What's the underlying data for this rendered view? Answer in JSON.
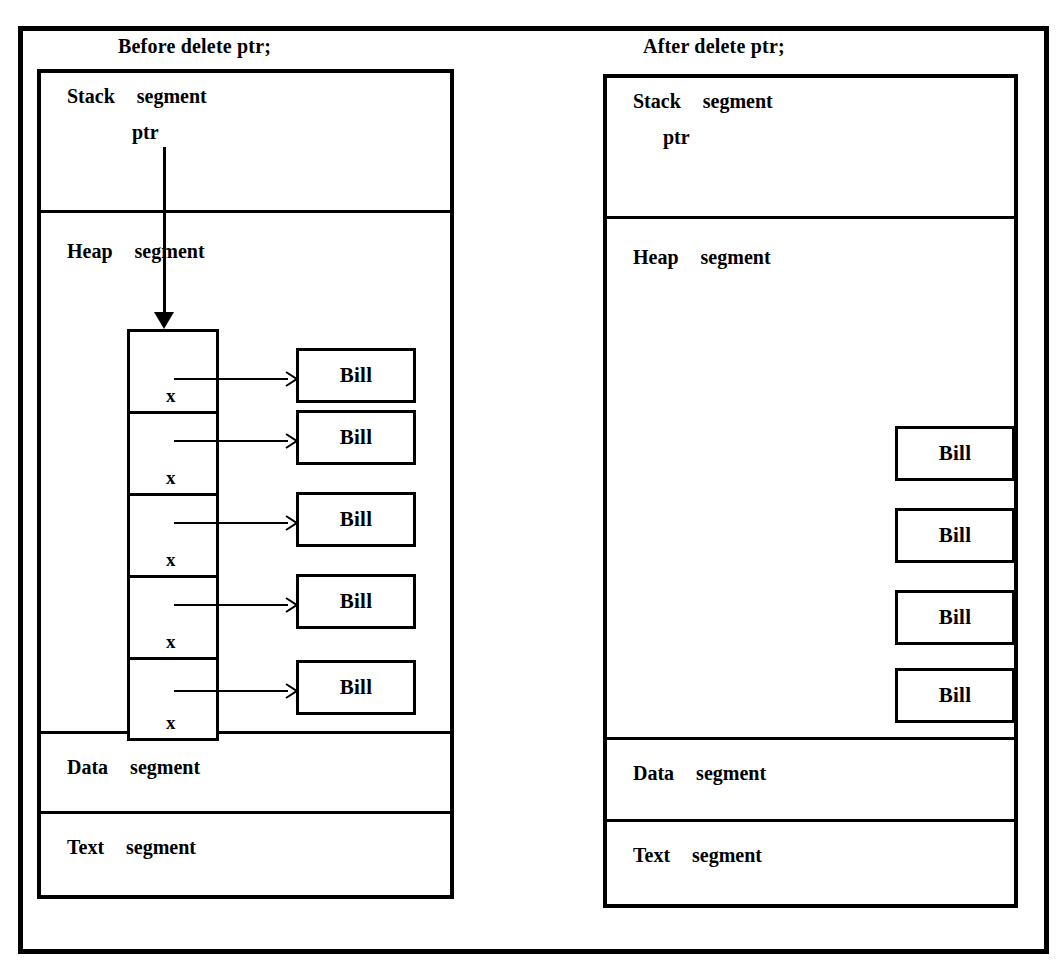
{
  "figure": {
    "ink_color": "#000000",
    "paper_color": "#ffffff"
  },
  "panels": [
    {
      "id": "before",
      "caption": "Before delete ptr;",
      "stack": {
        "segment_name": "Stack",
        "segment_word": "segment",
        "variable": "ptr",
        "pointer_is_dangling": false
      },
      "heap": {
        "segment_name": "Heap",
        "segment_word": "segment",
        "array": {
          "slot_count": 5,
          "slots": [
            {
              "value": "x",
              "points_to": "Bill"
            },
            {
              "value": "x",
              "points_to": "Bill"
            },
            {
              "value": "x",
              "points_to": "Bill"
            },
            {
              "value": "x",
              "points_to": "Bill"
            },
            {
              "value": "x",
              "points_to": "Bill"
            }
          ]
        },
        "objects": [
          {
            "label": "Bill"
          },
          {
            "label": "Bill"
          },
          {
            "label": "Bill"
          },
          {
            "label": "Bill"
          },
          {
            "label": "Bill"
          }
        ]
      },
      "data": {
        "segment_name": "Data",
        "segment_word": "segment"
      },
      "text": {
        "segment_name": "Text",
        "segment_word": "segment"
      }
    },
    {
      "id": "after",
      "caption": "After delete ptr;",
      "stack": {
        "segment_name": "Stack",
        "segment_word": "segment",
        "variable": "ptr",
        "pointer_is_dangling": true
      },
      "heap": {
        "segment_name": "Heap",
        "segment_word": "segment",
        "array": {
          "slot_count": 0,
          "slots": []
        },
        "objects": [
          {
            "label": "Bill"
          },
          {
            "label": "Bill"
          },
          {
            "label": "Bill"
          },
          {
            "label": "Bill"
          }
        ]
      },
      "data": {
        "segment_name": "Data",
        "segment_word": "segment"
      },
      "text": {
        "segment_name": "Text",
        "segment_word": "segment"
      }
    }
  ]
}
